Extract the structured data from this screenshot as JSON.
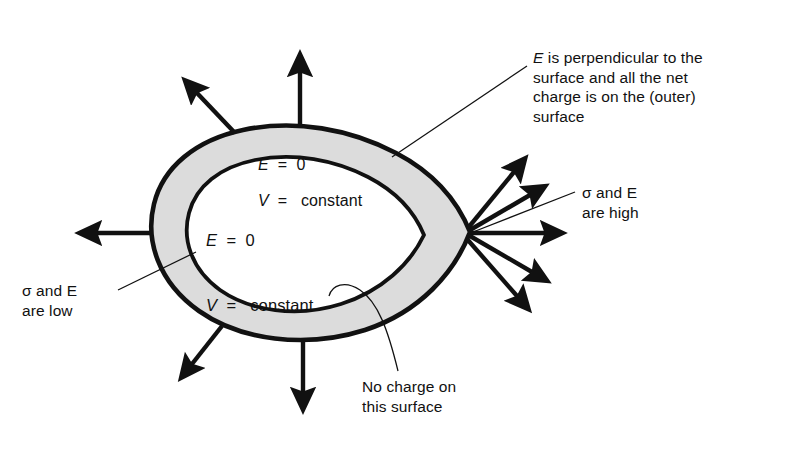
{
  "figure": {
    "background_color": "#ffffff",
    "ink_color": "#111111",
    "shell_fill_color": "#dcdcdc",
    "cavity_fill_color": "#ffffff"
  },
  "labels": {
    "perpendicular": {
      "text": "E is perpendicular to the\nsurface and all the net\ncharge is on the (outer)\nsurface",
      "lead_symbol": "E"
    },
    "high": {
      "text": "σ and E\nare high",
      "symbols": [
        "σ",
        "E"
      ]
    },
    "low": {
      "text": "σ and E\nare low",
      "symbols": [
        "σ",
        "E"
      ]
    },
    "no_charge": {
      "text": "No charge on\nthis surface"
    }
  },
  "formulas": {
    "shell": {
      "line1_symbol": "E",
      "line1_rest": "  =  0",
      "line2_symbol": "V",
      "line2_rest": "  =   constant"
    },
    "cavity": {
      "line1_symbol": "E",
      "line1_rest": "  =  0",
      "line2_symbol": "V",
      "line2_rest": "  =   constant"
    }
  },
  "field_arrows": {
    "count": 10,
    "description": "Field lines normal to the outer surface; dense at the pointed (right) end, sparse at the blunt (left) end",
    "groups": [
      {
        "name": "tip-cluster-right",
        "count": 5,
        "density": "high"
      },
      {
        "name": "top",
        "count": 2,
        "density": "low"
      },
      {
        "name": "left",
        "count": 1,
        "density": "low"
      },
      {
        "name": "bottom",
        "count": 2,
        "density": "low"
      }
    ]
  }
}
